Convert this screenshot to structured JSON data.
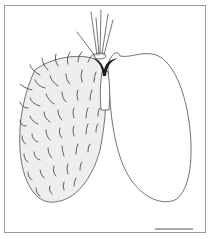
{
  "figure": {
    "type": "scientific line illustration",
    "colors": {
      "line": "#3a3a3a",
      "frame": "#9a9a9a",
      "shading": "#e6e6e6",
      "junction": "#1a1a1a",
      "background": "#ffffff"
    },
    "scale_bar": {
      "visible": true,
      "label": ""
    }
  }
}
